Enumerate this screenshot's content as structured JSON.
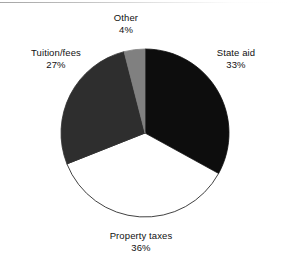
{
  "chart_data": {
    "type": "pie",
    "title": "",
    "subtitle": "",
    "xlabel": "",
    "ylabel": "",
    "legend_position": "none",
    "labels_position": "outside",
    "grid": false,
    "start_angle_deg": 0,
    "direction": "clockwise",
    "categories": [
      "State aid",
      "Property taxes",
      "Tuition/fees",
      "Other"
    ],
    "values": [
      33,
      36,
      27,
      4
    ],
    "value_unit": "%",
    "slices": [
      {
        "label": "State aid",
        "value": 33,
        "value_text": "33%",
        "color": "#0d0d0d",
        "stroke": "#0d0d0d",
        "start_angle_deg": 0,
        "end_angle_deg": 118.8,
        "label_position": "upper-right"
      },
      {
        "label": "Property taxes",
        "value": 36,
        "value_text": "36%",
        "color": "#ffffff",
        "stroke": "#111111",
        "start_angle_deg": 118.8,
        "end_angle_deg": 248.4,
        "label_position": "bottom-center"
      },
      {
        "label": "Tuition/fees",
        "value": 27,
        "value_text": "27%",
        "color": "#2e2e2e",
        "stroke": "#2e2e2e",
        "start_angle_deg": 248.4,
        "end_angle_deg": 345.6,
        "label_position": "upper-left"
      },
      {
        "label": "Other",
        "value": 4,
        "value_text": "4%",
        "color": "#808080",
        "stroke": "#808080",
        "start_angle_deg": 345.6,
        "end_angle_deg": 360,
        "label_position": "top-center"
      }
    ]
  },
  "canvas": {
    "background": "#ffffff",
    "center_x": 145,
    "center_y": 133,
    "radius": 84
  }
}
